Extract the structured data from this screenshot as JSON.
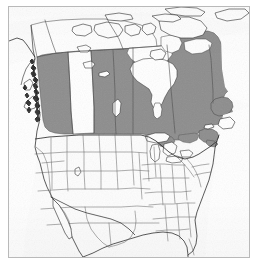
{
  "figure": {
    "kind": "thematic-choropleth-map",
    "region": "North America",
    "frame": {
      "border_color": "#b9b9b9",
      "background_color": "#fdfdfd",
      "outer_background_color": "#ffffff"
    }
  },
  "legend": {
    "visible": false,
    "highlight_meaning": "highlighted region",
    "entries": [
      {
        "label": "highlighted",
        "color": "#8d8d8d"
      },
      {
        "label": "not highlighted",
        "color": "#ffffff"
      }
    ]
  },
  "style": {
    "highlight_fill": "#8d8d8d",
    "plain_fill": "#ffffff",
    "water_fill": "#ffffff",
    "country_outline": "#1d1d1d",
    "subdivision_outline": "#595959",
    "coast_detail": "#2b2b2b"
  },
  "map_data": {
    "type": "choropleth",
    "projection": "conic",
    "highlighted_regions": [
      "British Columbia",
      "Saskatchewan",
      "Manitoba",
      "Ontario",
      "Quebec",
      "New Brunswick",
      "Nova Scotia",
      "Prince Edward Island",
      "Newfoundland and Labrador"
    ],
    "unhighlighted_regions": [
      "Alaska",
      "Yukon",
      "Northwest Territories",
      "Nunavut",
      "Alberta",
      "Greenland",
      "United States (contiguous)",
      "Mexico (northern)"
    ],
    "water_bodies": [
      "Hudson Bay",
      "James Bay",
      "Great Lakes",
      "Gulf of Mexico",
      "Atlantic Ocean",
      "Pacific Ocean",
      "Arctic Ocean"
    ],
    "labels": [],
    "annotations": []
  }
}
